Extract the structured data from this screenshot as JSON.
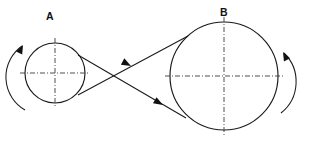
{
  "diagram": {
    "canvas": {
      "width": 311,
      "height": 147,
      "background": "#ffffff"
    },
    "stroke_color": "#1a1a1a",
    "centerline_color": "#3a3a3a",
    "pulleys": [
      {
        "id": "A",
        "label": "A",
        "label_x": 50,
        "label_y": 16,
        "cx": 55,
        "cy": 73,
        "r": 30,
        "rotation": "counterclockwise",
        "arc_side": "left"
      },
      {
        "id": "B",
        "label": "B",
        "label_x": 224,
        "label_y": 12,
        "cx": 224,
        "cy": 76,
        "r": 54,
        "rotation": "clockwise",
        "arc_side": "right"
      }
    ],
    "belt": {
      "type": "crossed",
      "crossing_x": 120,
      "crossing_y": 77,
      "strands": [
        {
          "name": "upper-strand",
          "from_x": 188,
          "from_y": 36,
          "to_x": 78,
          "to_y": 95,
          "direction": "toward-pulley-a",
          "arrow_x": 131,
          "arrow_y": 66,
          "arrow_angle": 208
        },
        {
          "name": "lower-strand",
          "from_x": 78,
          "from_y": 55,
          "to_x": 186,
          "to_y": 118,
          "direction": "toward-pulley-b",
          "arrow_x": 160,
          "arrow_y": 103,
          "arrow_angle": 30
        }
      ]
    }
  }
}
